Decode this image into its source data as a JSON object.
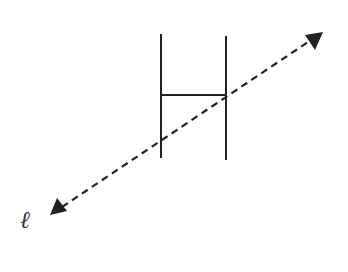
{
  "diagram": {
    "title": "",
    "line_label": "ℓ",
    "colors": {
      "stroke": "#222222",
      "background": "#ffffff"
    },
    "shape_H": {
      "left_post": {
        "x": 161,
        "y1": 34,
        "y2": 158
      },
      "right_post": {
        "x": 226,
        "y1": 36,
        "y2": 160
      },
      "crossbar": {
        "y": 95,
        "x1": 161,
        "x2": 226
      }
    },
    "line": {
      "style": "dashed",
      "arrows": "both",
      "start": {
        "x": 50,
        "y": 215
      },
      "end": {
        "x": 323,
        "y": 32
      }
    }
  }
}
